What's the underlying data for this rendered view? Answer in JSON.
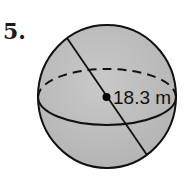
{
  "problem": {
    "number": "5."
  },
  "figure": {
    "shape": "sphere",
    "measurement_label": "18.3 m",
    "measurement_type": "radius",
    "colors": {
      "fill": "#bdbdbd",
      "stroke": "#111111",
      "background": "#ffffff"
    }
  }
}
